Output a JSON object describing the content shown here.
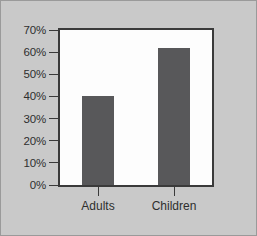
{
  "chart_data": {
    "type": "bar",
    "title": "",
    "subtitle": "",
    "xlabel": "",
    "ylabel": "",
    "categories": [
      "Adults",
      "Children"
    ],
    "values": [
      40,
      62
    ],
    "value_labels": [
      "",
      ""
    ],
    "ylim": [
      0,
      70
    ],
    "ytick_labels": [
      "70%",
      "60%",
      "50%",
      "40%",
      "30%",
      "20%",
      "10%",
      "0%"
    ],
    "ytick_values": [
      70,
      60,
      50,
      40,
      30,
      20,
      10,
      0
    ],
    "grid": false,
    "legend": null,
    "legend_position": "none",
    "annotations": [],
    "colors": {
      "bar": "#58585a",
      "plot_background": "#fdfdfd",
      "figure_background": "#c9c9c9",
      "axis": "#3a3a3a",
      "text": "#2e2e2e",
      "figure_border": "#9a9a9a"
    }
  }
}
